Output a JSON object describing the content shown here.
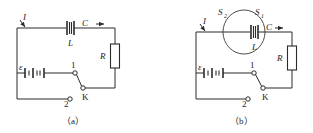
{
  "figure": {
    "type": "physics-circuit-diagram"
  },
  "panels": [
    {
      "id": "a",
      "caption": "（a）",
      "labels": {
        "current": "I",
        "capacitor": "C",
        "inductor": "L",
        "resistor": "R",
        "emf": "ε",
        "switch": "K",
        "contact_1": "1",
        "contact_2": "2"
      }
    },
    {
      "id": "b",
      "caption": "（b）",
      "labels": {
        "current": "I",
        "capacitor": "C",
        "inductor": "L",
        "resistor": "R",
        "emf": "ε",
        "switch": "K",
        "contact_1": "1",
        "contact_2": "2",
        "surface_1": "S",
        "surface_1_sub": "1",
        "surface_2": "S",
        "surface_2_sub": "2"
      }
    }
  ],
  "colors": {
    "wire": "#2b2b2b",
    "text": "#1a1a1a",
    "background": "#ffffff",
    "loop": "#3a3a3a"
  }
}
